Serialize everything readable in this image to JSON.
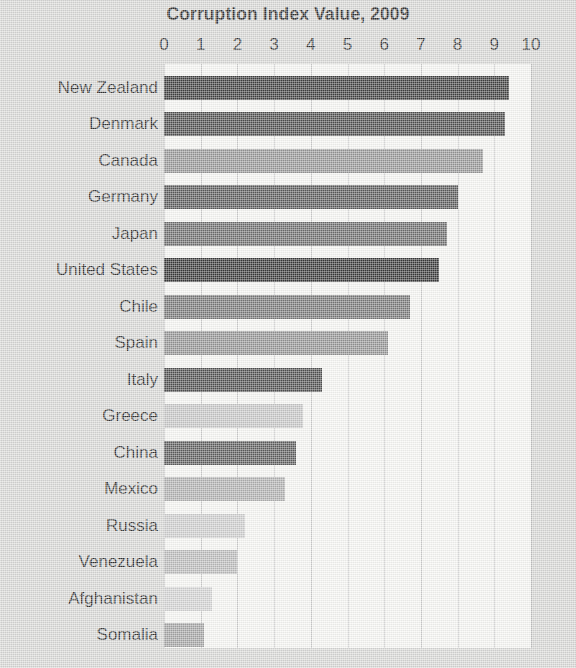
{
  "chart_data": {
    "type": "bar",
    "orientation": "horizontal",
    "title": "Corruption Index Value, 2009",
    "xlabel": "",
    "ylabel": "",
    "xlim": [
      0,
      10
    ],
    "xticks": [
      "0",
      "1",
      "2",
      "3",
      "4",
      "5",
      "6",
      "7",
      "8",
      "9",
      "10"
    ],
    "grid": "vertical",
    "legend": "none",
    "categories": [
      "New Zealand",
      "Denmark",
      "Canada",
      "Germany",
      "Japan",
      "United States",
      "Chile",
      "Spain",
      "Italy",
      "Greece",
      "China",
      "Mexico",
      "Russia",
      "Venezuela",
      "Afghanistan",
      "Somalia"
    ],
    "values": [
      9.4,
      9.3,
      8.7,
      8.0,
      7.7,
      7.5,
      6.7,
      6.1,
      4.3,
      3.8,
      3.6,
      3.3,
      2.2,
      2.0,
      1.3,
      1.1
    ],
    "bar_colors": [
      "#2b2b2b",
      "#3b3b3b",
      "#8d8d8d",
      "#4a4a4a",
      "#5f5f5f",
      "#232323",
      "#6b6b6b",
      "#8a8a8a",
      "#3d3d3d",
      "#c2c2c2",
      "#4d4d4d",
      "#aaaaaa",
      "#cacaca",
      "#b6b6b6",
      "#d0d0d0",
      "#9c9c9c"
    ]
  },
  "colors": {
    "page_background": "#d6d6d4",
    "plot_background": "#f7f7f4",
    "gridline": "#c9c9c9",
    "text": "#1c1c1c"
  },
  "bleed_text": {
    "lines": [
      "Mexico's relations with the United States",
      "of the many problems that",
      "illegal immigration and",
      "drug trafficking",
      "Social Problems",
      "Mexico has one of the largest",
      "environmental problems"
    ]
  }
}
